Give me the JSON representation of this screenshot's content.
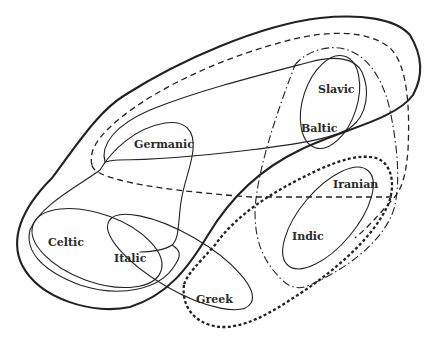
{
  "diagram": {
    "title": "",
    "labels": {
      "germanic": "Germanic",
      "slavic": "Slavic",
      "baltic": "Baltic",
      "iranian": "Iranian",
      "indic": "Indic",
      "celtic": "Celtic",
      "italic": "Italic",
      "greek": "Greek"
    },
    "line_styles": [
      {
        "name": "thick-solid",
        "desc": "outer boundary (northwest group)"
      },
      {
        "name": "long-dashed",
        "desc": "isogloss spanning Germanic to Baltic-Slavic and Indo-Iranian"
      },
      {
        "name": "dash-dot",
        "desc": "isogloss enclosing Baltic-Slavic and Indo-Iranian"
      },
      {
        "name": "heavy-dotted",
        "desc": "isogloss enclosing Greek and Indo-Iranian"
      },
      {
        "name": "thin-solid",
        "desc": "individual branch boundaries and sub-groupings"
      }
    ],
    "colors": {
      "ink": "#222222",
      "background": "#ffffff"
    }
  }
}
